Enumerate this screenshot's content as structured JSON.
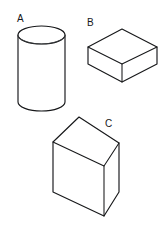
{
  "figure": {
    "background_color": "#ffffff",
    "line_color": "#17181a",
    "fill_color": "#ffffff",
    "width": 165,
    "height": 237
  },
  "labels": {
    "a": "A",
    "b": "B",
    "c": "C"
  },
  "shapes": [
    {
      "id": "cylinder-a",
      "label": "A",
      "kind": "cylinder",
      "label_position": {
        "x": 17,
        "y": 22
      },
      "geometry": {
        "center_x": 41.5,
        "top_ellipse_cy": 35,
        "bottom_ellipse_cy": 102,
        "radius_x": 23.5,
        "radius_y": 9
      }
    },
    {
      "id": "box-b",
      "label": "B",
      "kind": "rectangular-box-flat",
      "label_position": {
        "x": 87,
        "y": 26
      },
      "geometry": {
        "top_face": [
          [
            88,
            47
          ],
          [
            122,
            29
          ],
          [
            157,
            47
          ],
          [
            122,
            64
          ]
        ],
        "front_left_face": [
          [
            88,
            47
          ],
          [
            122,
            64
          ],
          [
            122,
            82
          ],
          [
            88,
            64
          ]
        ],
        "front_right_face": [
          [
            122,
            64
          ],
          [
            157,
            47
          ],
          [
            157,
            64
          ],
          [
            122,
            82
          ]
        ]
      }
    },
    {
      "id": "slab-c",
      "label": "C",
      "kind": "rectangular-slab-upright",
      "label_position": {
        "x": 105,
        "y": 127
      },
      "geometry": {
        "front_face": [
          [
            53,
            142
          ],
          [
            79,
            117
          ],
          [
            104,
            166
          ],
          [
            104,
            216
          ],
          [
            53,
            192
          ]
        ],
        "top_face": [
          [
            53,
            142
          ],
          [
            79,
            117
          ],
          [
            119,
            143
          ],
          [
            104,
            166
          ]
        ],
        "side_face": [
          [
            104,
            166
          ],
          [
            119,
            143
          ],
          [
            119,
            192
          ],
          [
            104,
            216
          ]
        ]
      }
    }
  ]
}
